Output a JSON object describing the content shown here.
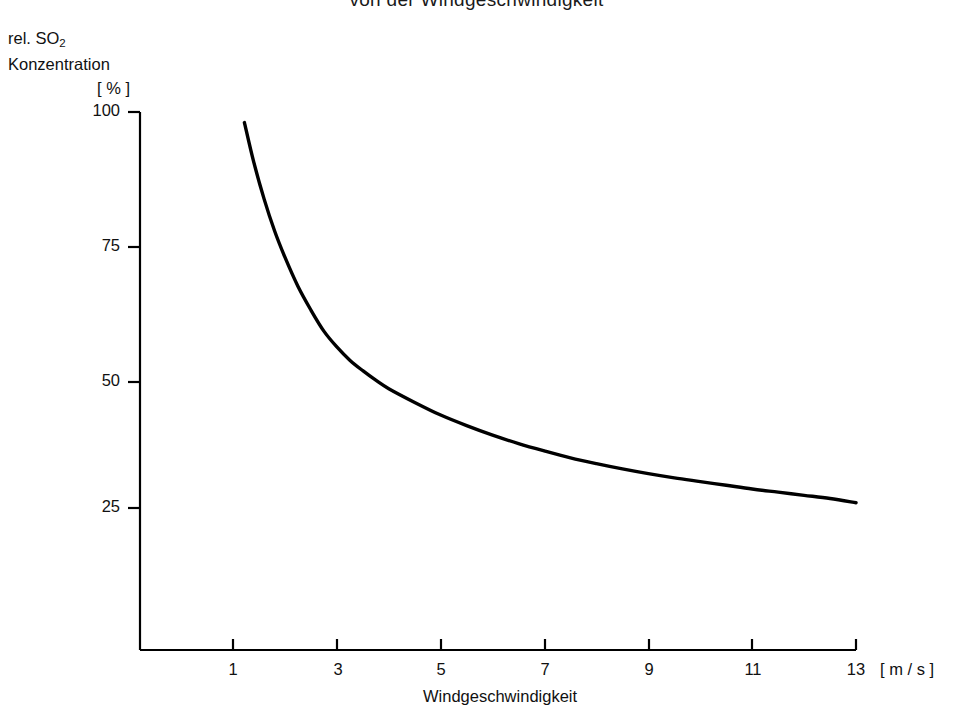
{
  "title": "von der Windgeschwindigkeit",
  "y_axis_caption": {
    "line1": "rel. SO",
    "line1_sub": "2",
    "line2": "Konzentration",
    "unit": "[ % ]"
  },
  "x_axis_caption": {
    "name": "Windgeschwindigkeit",
    "unit": "[ m / s ]"
  },
  "ticks": {
    "y": [
      "100",
      "75",
      "50",
      "25"
    ],
    "x": [
      "1",
      "3",
      "5",
      "7",
      "9",
      "11",
      "13"
    ]
  },
  "chart_data": {
    "type": "line",
    "title": "von der Windgeschwindigkeit",
    "xlabel": "Windgeschwindigkeit [ m / s ]",
    "ylabel": "rel. SO2 Konzentration [ % ]",
    "xlim": [
      0,
      13.6
    ],
    "ylim": [
      0,
      102
    ],
    "xticks": [
      1,
      3,
      5,
      7,
      9,
      11,
      13
    ],
    "yticks": [
      25,
      50,
      75,
      100
    ],
    "grid": false,
    "legend": null,
    "series": [
      {
        "name": "rel. SO2 Konzentration",
        "color": "#000000",
        "x": [
          1.22,
          1.4,
          1.6,
          1.8,
          2.0,
          2.25,
          2.5,
          2.75,
          3.0,
          3.25,
          3.5,
          3.75,
          4.0,
          4.5,
          5.0,
          5.5,
          6.0,
          6.5,
          7.0,
          7.5,
          8.0,
          8.5,
          9.0,
          9.5,
          10.0,
          10.5,
          11.0,
          11.5,
          12.0,
          12.5,
          13.0
        ],
        "y": [
          98.0,
          90.5,
          83.5,
          77.5,
          72.5,
          67.0,
          62.5,
          58.5,
          55.5,
          53.0,
          51.0,
          49.2,
          47.6,
          45.0,
          42.6,
          40.6,
          38.8,
          37.2,
          35.8,
          34.5,
          33.4,
          32.4,
          31.5,
          30.7,
          30.0,
          29.3,
          28.6,
          28.0,
          27.4,
          26.8,
          26.0
        ]
      }
    ]
  },
  "geometry": {
    "plot_left": 140,
    "plot_right": 856,
    "plot_top": 112,
    "plot_bottom": 650,
    "y_top_value": 100,
    "y_top_px": 112,
    "y_px_per_unit": 5.28,
    "x_unit1_px": 233,
    "x_px_per_unit": 51.92
  }
}
